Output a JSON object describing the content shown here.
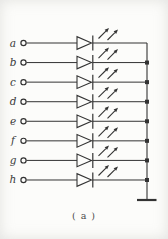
{
  "diagram": {
    "type": "schematic",
    "inputs": [
      "a",
      "b",
      "c",
      "d",
      "e",
      "f",
      "g",
      "h"
    ],
    "caption": "( a )",
    "components": {
      "terminal": "open-circle-terminal",
      "led": "led-diode-symbol",
      "emission": "light-emission-arrows",
      "junction": "junction-dot",
      "bus": "common-bus-wire",
      "ground": "ground-symbol"
    },
    "colors": {
      "line": "#333333",
      "label": "#3a3a3a",
      "background": "#fcfcfa",
      "caption": "#4a4a4a"
    }
  }
}
